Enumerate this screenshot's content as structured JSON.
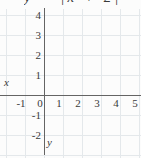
{
  "header": {
    "equation_clipped": "y = |x + 2|"
  },
  "chart_data": {
    "type": "scatter",
    "title": "",
    "series": [],
    "note": "empty coordinate plane, no data points plotted",
    "xlabel": "x",
    "ylabel": "y",
    "x_ticks": [
      -1,
      0,
      1,
      2,
      3,
      4,
      5
    ],
    "y_ticks": [
      4,
      3,
      2,
      1,
      -1,
      -2
    ],
    "xlim": [
      -2,
      5.1
    ],
    "ylim": [
      -3,
      4.3
    ],
    "grid": true,
    "legend": false
  },
  "colors": {
    "background": "#fcfcfc",
    "gridline": "#e4e8eb",
    "axis": "#646464",
    "text": "#3a3a3a"
  }
}
